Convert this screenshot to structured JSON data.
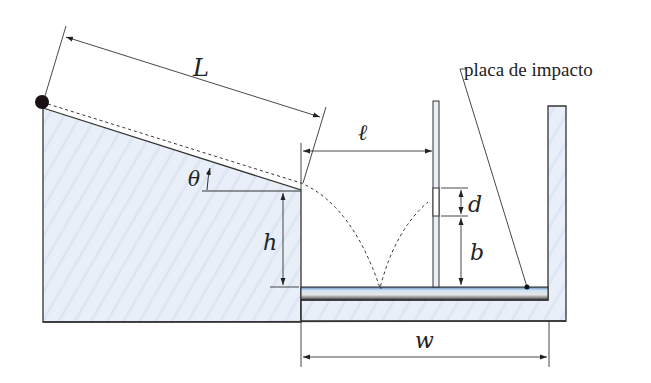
{
  "diagram": {
    "labels": {
      "L": "L",
      "theta": "θ",
      "h": "h",
      "ell": "ℓ",
      "d": "d",
      "b": "b",
      "w": "w",
      "impact_plate": "placa de impacto"
    },
    "colors": {
      "fill": "#eaf0f8",
      "stroke": "#333333",
      "ball": "#1a0f14",
      "plate_top": "#8fb8e0",
      "plate_bottom": "#444444"
    }
  }
}
